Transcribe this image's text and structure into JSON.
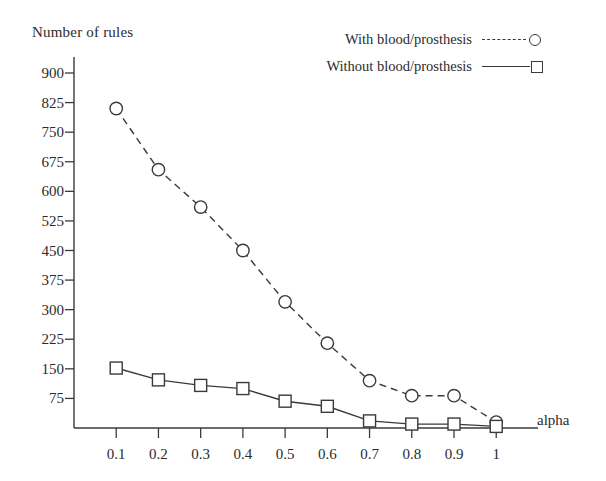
{
  "chart_data": {
    "type": "line",
    "title": "",
    "ylabel": "Number of rules",
    "xlabel": "alpha",
    "x": [
      0.1,
      0.2,
      0.3,
      0.4,
      0.5,
      0.6,
      0.7,
      0.8,
      0.9,
      1
    ],
    "xtick_labels": [
      "0.1",
      "0.2",
      "0.3",
      "0.4",
      "0.5",
      "0.6",
      "0.7",
      "0.8",
      "0.9",
      "1"
    ],
    "ytick_labels": [
      "900",
      "825",
      "750",
      "675",
      "600",
      "525",
      "450",
      "375",
      "300",
      "225",
      "150",
      "75"
    ],
    "yticks": [
      900,
      825,
      750,
      675,
      600,
      525,
      450,
      375,
      300,
      225,
      150,
      75
    ],
    "ylim": [
      0,
      900
    ],
    "xlim": [
      0,
      1.08
    ],
    "grid": false,
    "legend_position": "top-right",
    "series": [
      {
        "name": "With blood/prosthesis",
        "marker": "circle",
        "linestyle": "dashed",
        "color": "#3a3a3a",
        "values": [
          810,
          655,
          560,
          450,
          320,
          215,
          120,
          82,
          82,
          15
        ]
      },
      {
        "name": "Without blood/prosthesis",
        "marker": "square",
        "linestyle": "solid",
        "color": "#3a3a3a",
        "values": [
          152,
          122,
          108,
          100,
          68,
          55,
          18,
          10,
          10,
          4
        ]
      }
    ]
  },
  "axes": {
    "y_title": "Number of rules",
    "x_title": "alpha"
  }
}
